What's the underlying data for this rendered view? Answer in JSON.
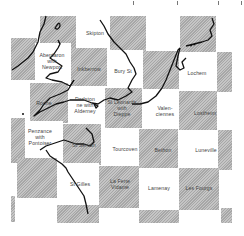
{
  "map": {
    "type": "checkerboard town-twinning map",
    "colors": {
      "gray_square": "#b5b5b5",
      "white_square": "#ffffff",
      "coastline": "#111111",
      "label": "#444444"
    },
    "labels": [
      {
        "id": "skipton",
        "text": "Skipton",
        "x": 95,
        "y": 33
      },
      {
        "id": "aberdaron",
        "text": "Aberdaron\nwith\nNewport",
        "x": 52,
        "y": 61
      },
      {
        "id": "inkberrow",
        "text": "Inkberrow",
        "x": 89,
        "y": 69
      },
      {
        "id": "bury-st",
        "text": "Bury St",
        "x": 123,
        "y": 71
      },
      {
        "id": "lochem",
        "text": "Lochem",
        "x": 197,
        "y": 73
      },
      {
        "id": "roche",
        "text": "Roche",
        "x": 44,
        "y": 103
      },
      {
        "id": "dorlston",
        "text": "Dorlston\nne with\nAlderney",
        "x": 85,
        "y": 105
      },
      {
        "id": "st-leonards",
        "text": "St Leonards\nwith\nDieppe",
        "x": 122,
        "y": 108
      },
      {
        "id": "valenciennes",
        "text": "Valen-\nciennes",
        "x": 165,
        "y": 111
      },
      {
        "id": "lostheim",
        "text": "Lostheim",
        "x": 205,
        "y": 113
      },
      {
        "id": "penzance",
        "text": "Penzance\nwith\nPontoiser",
        "x": 40,
        "y": 137
      },
      {
        "id": "st-servan",
        "text": "St Servan",
        "x": 84,
        "y": 145
      },
      {
        "id": "tourcoven",
        "text": "Tourcoven",
        "x": 125,
        "y": 149
      },
      {
        "id": "bethon",
        "text": "Bethon",
        "x": 163,
        "y": 150
      },
      {
        "id": "luneville",
        "text": "Luneville",
        "x": 206,
        "y": 150
      },
      {
        "id": "st-gilles",
        "text": "St Gilles",
        "x": 80,
        "y": 184
      },
      {
        "id": "la-ferte-vidame",
        "text": "La Ferte\nVidame",
        "x": 120,
        "y": 184
      },
      {
        "id": "lamenay",
        "text": "Lamenay",
        "x": 159,
        "y": 188
      },
      {
        "id": "les-fourgs",
        "text": "Les Fourgs",
        "x": 199,
        "y": 188
      }
    ]
  }
}
